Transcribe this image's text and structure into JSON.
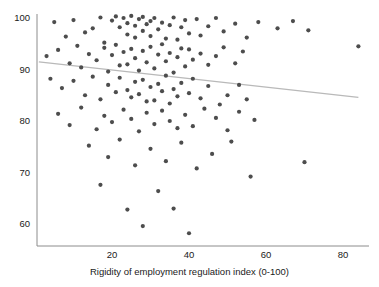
{
  "chart_data": {
    "type": "scatter",
    "title": "",
    "xlabel": "Rigidity of employment regulation index (0-100)",
    "ylabel": "",
    "xlim": [
      0,
      88
    ],
    "ylim": [
      56,
      101
    ],
    "xticks": [
      20,
      40,
      60,
      80
    ],
    "yticks": [
      60,
      70,
      80,
      90,
      100
    ],
    "grid": false,
    "legend": null,
    "point_color": "#4d4d4d",
    "point_radius": 2.1,
    "trendline": {
      "color": "#b9b9b9",
      "width": 1.2,
      "x": [
        1,
        84
      ],
      "y": [
        91.5,
        84.6
      ]
    },
    "series": [
      {
        "name": "countries",
        "points": [
          [
            5,
            99.2
          ],
          [
            8,
            96.4
          ],
          [
            10,
            99.6
          ],
          [
            13,
            97.2
          ],
          [
            15,
            98.0
          ],
          [
            17,
            100.1
          ],
          [
            18,
            95.2
          ],
          [
            20,
            99.5
          ],
          [
            21,
            100.3
          ],
          [
            22,
            98.2
          ],
          [
            23,
            100.0
          ],
          [
            24,
            99.0
          ],
          [
            24,
            96.8
          ],
          [
            25,
            100.4
          ],
          [
            26,
            98.5
          ],
          [
            26,
            96.2
          ],
          [
            27,
            99.8
          ],
          [
            28,
            97.5
          ],
          [
            28,
            100.2
          ],
          [
            29,
            98.8
          ],
          [
            30,
            96.5
          ],
          [
            30,
            99.4
          ],
          [
            31,
            100.0
          ],
          [
            32,
            97.8
          ],
          [
            33,
            99.1
          ],
          [
            34,
            96.0
          ],
          [
            35,
            98.6
          ],
          [
            36,
            100.1
          ],
          [
            37,
            95.8
          ],
          [
            38,
            98.2
          ],
          [
            39,
            99.6
          ],
          [
            40,
            97.0
          ],
          [
            42,
            99.8
          ],
          [
            43,
            96.6
          ],
          [
            45,
            98.4
          ],
          [
            47,
            100.0
          ],
          [
            49,
            97.4
          ],
          [
            52,
            98.9
          ],
          [
            55,
            96.2
          ],
          [
            58,
            99.2
          ],
          [
            63,
            98.0
          ],
          [
            67,
            99.4
          ],
          [
            71,
            97.6
          ],
          [
            84,
            94.5
          ],
          [
            3,
            92.6
          ],
          [
            6,
            93.8
          ],
          [
            9,
            91.2
          ],
          [
            11,
            94.6
          ],
          [
            12,
            90.4
          ],
          [
            14,
            93.0
          ],
          [
            16,
            91.8
          ],
          [
            18,
            94.2
          ],
          [
            19,
            89.6
          ],
          [
            20,
            92.8
          ],
          [
            21,
            94.8
          ],
          [
            22,
            90.8
          ],
          [
            23,
            93.4
          ],
          [
            24,
            91.0
          ],
          [
            25,
            94.0
          ],
          [
            26,
            92.2
          ],
          [
            27,
            89.8
          ],
          [
            28,
            93.6
          ],
          [
            29,
            91.4
          ],
          [
            30,
            94.4
          ],
          [
            31,
            90.2
          ],
          [
            32,
            92.9
          ],
          [
            33,
            94.9
          ],
          [
            34,
            91.6
          ],
          [
            35,
            93.2
          ],
          [
            36,
            89.4
          ],
          [
            37,
            92.4
          ],
          [
            38,
            94.1
          ],
          [
            39,
            90.6
          ],
          [
            40,
            93.9
          ],
          [
            41,
            91.9
          ],
          [
            43,
            93.1
          ],
          [
            45,
            90.9
          ],
          [
            47,
            92.6
          ],
          [
            49,
            94.3
          ],
          [
            52,
            91.2
          ],
          [
            54,
            93.5
          ],
          [
            4,
            88.2
          ],
          [
            7,
            86.4
          ],
          [
            10,
            87.8
          ],
          [
            13,
            85.0
          ],
          [
            15,
            88.6
          ],
          [
            17,
            84.2
          ],
          [
            19,
            87.0
          ],
          [
            21,
            85.6
          ],
          [
            22,
            88.4
          ],
          [
            24,
            86.0
          ],
          [
            25,
            84.6
          ],
          [
            26,
            87.6
          ],
          [
            27,
            85.2
          ],
          [
            28,
            88.0
          ],
          [
            29,
            83.8
          ],
          [
            30,
            86.6
          ],
          [
            31,
            84.0
          ],
          [
            32,
            87.2
          ],
          [
            33,
            85.8
          ],
          [
            34,
            88.8
          ],
          [
            35,
            83.4
          ],
          [
            36,
            86.2
          ],
          [
            37,
            84.8
          ],
          [
            38,
            87.4
          ],
          [
            40,
            85.4
          ],
          [
            41,
            88.2
          ],
          [
            43,
            84.4
          ],
          [
            45,
            86.8
          ],
          [
            48,
            83.2
          ],
          [
            50,
            85.0
          ],
          [
            53,
            87.0
          ],
          [
            55,
            84.2
          ],
          [
            6,
            81.4
          ],
          [
            9,
            79.2
          ],
          [
            12,
            82.6
          ],
          [
            16,
            78.4
          ],
          [
            18,
            81.0
          ],
          [
            20,
            79.8
          ],
          [
            23,
            82.2
          ],
          [
            25,
            80.4
          ],
          [
            27,
            78.0
          ],
          [
            29,
            81.6
          ],
          [
            31,
            79.4
          ],
          [
            33,
            82.0
          ],
          [
            35,
            80.0
          ],
          [
            37,
            78.6
          ],
          [
            39,
            81.2
          ],
          [
            41,
            79.0
          ],
          [
            44,
            82.4
          ],
          [
            47,
            80.6
          ],
          [
            50,
            78.2
          ],
          [
            53,
            81.8
          ],
          [
            57,
            80.2
          ],
          [
            14,
            75.2
          ],
          [
            19,
            73.0
          ],
          [
            22,
            76.4
          ],
          [
            26,
            71.4
          ],
          [
            30,
            74.6
          ],
          [
            34,
            72.2
          ],
          [
            38,
            75.8
          ],
          [
            42,
            70.8
          ],
          [
            46,
            73.6
          ],
          [
            51,
            76.0
          ],
          [
            56,
            69.2
          ],
          [
            70,
            72.0
          ],
          [
            17,
            67.6
          ],
          [
            24,
            62.8
          ],
          [
            32,
            66.4
          ],
          [
            36,
            63.0
          ],
          [
            28,
            59.6
          ],
          [
            40,
            58.2
          ]
        ]
      }
    ]
  },
  "axes": {
    "y_tick_labels": [
      "100",
      "90",
      "80",
      "70",
      "60"
    ],
    "x_tick_labels": [
      "20",
      "40",
      "60",
      "80"
    ],
    "x_axis_title": "Rigidity of employment regulation index (0-100)"
  },
  "header": {
    "cropped_title": ""
  },
  "colors": {
    "point": "#4d4d4d",
    "trendline": "#b9b9b9",
    "axis": "#8c8c8c",
    "text": "#1a1a1a",
    "background": "#ffffff"
  }
}
